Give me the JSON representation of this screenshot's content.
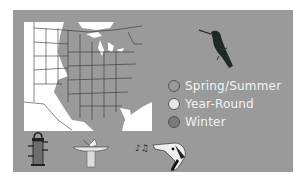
{
  "legend": {
    "items": [
      {
        "label": "Spring/Summer",
        "color": "#9a9a9a"
      },
      {
        "label": "Year-Round",
        "color": "#e6e6e6"
      },
      {
        "label": "Winter",
        "color": "#7a7a7a"
      }
    ]
  },
  "icons": {
    "bird": "hummingbird-icon",
    "feeder": "tube-feeder-icon",
    "birdbath": "birdbath-icon",
    "song": "singing-bird-icon"
  },
  "colors": {
    "panel": "#9a9a9a",
    "map_land": "#ffffff",
    "range": "#9a9a9a",
    "legend_text": "#f2f2f2"
  }
}
